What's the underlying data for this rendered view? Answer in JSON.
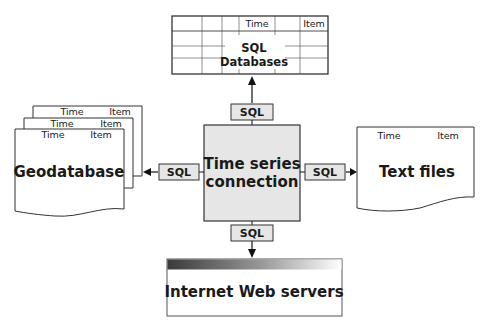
{
  "diagram": {
    "center": {
      "label_line1": "Time series",
      "label_line2": "connection",
      "fill": "#e6e6e6"
    },
    "sql_database": {
      "label_line1": "SQL",
      "label_line2": "Databases",
      "col_time": "Time",
      "col_item": "Item"
    },
    "geodatabase": {
      "label": "Geodatabase",
      "col_time": "Time",
      "col_item": "Item"
    },
    "text_files": {
      "label": "Text files",
      "col_time": "Time",
      "col_item": "Item"
    },
    "web_servers": {
      "label": "Internet Web servers"
    },
    "connectors": {
      "top": "SQL",
      "left": "SQL",
      "right": "SQL",
      "bottom": "SQL"
    }
  }
}
